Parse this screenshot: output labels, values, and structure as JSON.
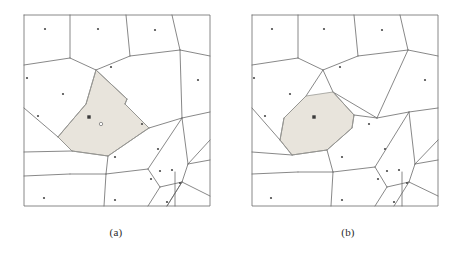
{
  "figure": {
    "type": "voronoi-diagram-pair",
    "background_color": "#ffffff",
    "edge_color": "#6a6a6a",
    "highlight_fill_color": "#e8e4dc",
    "highlight_edge_color": "#9a9a96",
    "site_color": "#4a4a4a"
  },
  "panels": [
    {
      "id": "a",
      "caption": "(a)",
      "bbox": {
        "x": 24,
        "y": 15,
        "width": 186,
        "height": 191
      },
      "highlight": {
        "kind": "narrow-corridor-cell",
        "label": "o",
        "label_x": 101,
        "label_y": 124,
        "marker_x": 89,
        "marker_y": 117,
        "marker_shape": "filled-square",
        "polygon": [
          [
            96,
            70
          ],
          [
            127,
            99
          ],
          [
            125,
            104
          ],
          [
            149,
            128
          ],
          [
            143,
            132
          ],
          [
            108,
            156
          ],
          [
            72,
            151
          ],
          [
            58,
            137
          ],
          [
            63,
            131
          ],
          [
            86,
            104
          ]
        ]
      },
      "sites": [
        [
          45,
          29
        ],
        [
          98,
          29
        ],
        [
          155,
          30
        ],
        [
          27,
          78
        ],
        [
          63,
          94
        ],
        [
          111,
          67
        ],
        [
          198,
          80
        ],
        [
          38,
          116
        ],
        [
          142,
          124
        ],
        [
          89,
          117
        ],
        [
          115,
          157
        ],
        [
          158,
          149
        ],
        [
          160,
          171
        ],
        [
          172,
          170
        ],
        [
          151,
          179
        ],
        [
          180,
          183
        ],
        [
          44,
          198
        ],
        [
          115,
          200
        ],
        [
          167,
          202
        ]
      ],
      "edges": [
        [
          [
            24,
            15
          ],
          [
            210,
            15
          ],
          [
            210,
            206
          ],
          [
            24,
            206
          ],
          [
            24,
            15
          ]
        ],
        [
          [
            70,
            15
          ],
          [
            70,
            58
          ]
        ],
        [
          [
            70,
            58
          ],
          [
            24,
            65
          ]
        ],
        [
          [
            70,
            58
          ],
          [
            96,
            70
          ]
        ],
        [
          [
            126,
            15
          ],
          [
            130,
            56
          ]
        ],
        [
          [
            130,
            56
          ],
          [
            96,
            70
          ]
        ],
        [
          [
            130,
            56
          ],
          [
            180,
            50
          ]
        ],
        [
          [
            180,
            50
          ],
          [
            210,
            56
          ]
        ],
        [
          [
            180,
            50
          ],
          [
            172,
            15
          ]
        ],
        [
          [
            96,
            70
          ],
          [
            86,
            104
          ]
        ],
        [
          [
            86,
            104
          ],
          [
            63,
            131
          ]
        ],
        [
          [
            63,
            131
          ],
          [
            58,
            137
          ]
        ],
        [
          [
            58,
            137
          ],
          [
            24,
            108
          ]
        ],
        [
          [
            58,
            137
          ],
          [
            72,
            151
          ]
        ],
        [
          [
            72,
            151
          ],
          [
            24,
            152
          ]
        ],
        [
          [
            72,
            151
          ],
          [
            108,
            156
          ]
        ],
        [
          [
            108,
            156
          ],
          [
            143,
            132
          ]
        ],
        [
          [
            143,
            132
          ],
          [
            149,
            128
          ]
        ],
        [
          [
            149,
            128
          ],
          [
            182,
            118
          ]
        ],
        [
          [
            182,
            118
          ],
          [
            210,
            112
          ]
        ],
        [
          [
            182,
            118
          ],
          [
            180,
            50
          ]
        ],
        [
          [
            127,
            99
          ],
          [
            125,
            104
          ]
        ],
        [
          [
            96,
            70
          ],
          [
            127,
            99
          ]
        ],
        [
          [
            125,
            104
          ],
          [
            149,
            128
          ]
        ],
        [
          [
            108,
            156
          ],
          [
            106,
            174
          ]
        ],
        [
          [
            106,
            174
          ],
          [
            70,
            174
          ]
        ],
        [
          [
            70,
            174
          ],
          [
            24,
            176
          ]
        ],
        [
          [
            106,
            174
          ],
          [
            104,
            206
          ]
        ],
        [
          [
            106,
            174
          ],
          [
            148,
            169
          ]
        ],
        [
          [
            148,
            169
          ],
          [
            182,
            118
          ]
        ],
        [
          [
            148,
            169
          ],
          [
            160,
            187
          ]
        ],
        [
          [
            160,
            187
          ],
          [
            148,
            206
          ]
        ],
        [
          [
            160,
            187
          ],
          [
            182,
            182
          ]
        ],
        [
          [
            182,
            182
          ],
          [
            167,
            206
          ]
        ],
        [
          [
            182,
            182
          ],
          [
            188,
            164
          ]
        ],
        [
          [
            188,
            164
          ],
          [
            182,
            118
          ]
        ],
        [
          [
            188,
            164
          ],
          [
            210,
            160
          ]
        ],
        [
          [
            182,
            182
          ],
          [
            210,
            196
          ]
        ],
        [
          [
            167,
            206
          ],
          [
            182,
            182
          ]
        ],
        [
          [
            175,
            172
          ],
          [
            175,
            206
          ]
        ],
        [
          [
            188,
            164
          ],
          [
            210,
            140
          ]
        ]
      ]
    },
    {
      "id": "b",
      "caption": "(b)",
      "bbox": {
        "x": 20,
        "y": 15,
        "width": 186,
        "height": 191
      },
      "highlight": {
        "kind": "wide-elongated-cell",
        "marker_x": 82,
        "marker_y": 117,
        "marker_shape": "filled-square",
        "polygon": [
          [
            101,
            92
          ],
          [
            122,
            115
          ],
          [
            120,
            128
          ],
          [
            95,
            150
          ],
          [
            60,
            155
          ],
          [
            48,
            140
          ],
          [
            52,
            118
          ],
          [
            74,
            96
          ]
        ]
      },
      "sites": [
        [
          40,
          29
        ],
        [
          92,
          29
        ],
        [
          150,
          30
        ],
        [
          22,
          78
        ],
        [
          58,
          94
        ],
        [
          108,
          67
        ],
        [
          193,
          80
        ],
        [
          33,
          116
        ],
        [
          137,
          124
        ],
        [
          82,
          117
        ],
        [
          110,
          157
        ],
        [
          153,
          149
        ],
        [
          155,
          171
        ],
        [
          167,
          170
        ],
        [
          146,
          179
        ],
        [
          175,
          183
        ],
        [
          39,
          198
        ],
        [
          110,
          200
        ],
        [
          162,
          202
        ]
      ],
      "edges": [
        [
          [
            20,
            15
          ],
          [
            206,
            15
          ],
          [
            206,
            206
          ],
          [
            20,
            206
          ],
          [
            20,
            15
          ]
        ],
        [
          [
            66,
            15
          ],
          [
            66,
            58
          ]
        ],
        [
          [
            66,
            58
          ],
          [
            20,
            65
          ]
        ],
        [
          [
            66,
            58
          ],
          [
            91,
            70
          ]
        ],
        [
          [
            122,
            15
          ],
          [
            126,
            56
          ]
        ],
        [
          [
            126,
            56
          ],
          [
            91,
            70
          ]
        ],
        [
          [
            126,
            56
          ],
          [
            176,
            50
          ]
        ],
        [
          [
            176,
            50
          ],
          [
            206,
            56
          ]
        ],
        [
          [
            176,
            50
          ],
          [
            168,
            15
          ]
        ],
        [
          [
            91,
            70
          ],
          [
            74,
            96
          ]
        ],
        [
          [
            74,
            96
          ],
          [
            52,
            118
          ]
        ],
        [
          [
            52,
            118
          ],
          [
            48,
            140
          ]
        ],
        [
          [
            48,
            140
          ],
          [
            20,
            108
          ]
        ],
        [
          [
            48,
            140
          ],
          [
            60,
            155
          ]
        ],
        [
          [
            60,
            155
          ],
          [
            20,
            152
          ]
        ],
        [
          [
            60,
            155
          ],
          [
            95,
            150
          ]
        ],
        [
          [
            95,
            150
          ],
          [
            120,
            128
          ]
        ],
        [
          [
            120,
            128
          ],
          [
            122,
            115
          ]
        ],
        [
          [
            122,
            115
          ],
          [
            101,
            92
          ]
        ],
        [
          [
            101,
            92
          ],
          [
            91,
            70
          ]
        ],
        [
          [
            101,
            92
          ],
          [
            145,
            118
          ]
        ],
        [
          [
            145,
            118
          ],
          [
            122,
            115
          ]
        ],
        [
          [
            145,
            118
          ],
          [
            176,
            50
          ]
        ],
        [
          [
            145,
            118
          ],
          [
            177,
            112
          ]
        ],
        [
          [
            177,
            112
          ],
          [
            206,
            108
          ]
        ],
        [
          [
            95,
            150
          ],
          [
            101,
            172
          ]
        ],
        [
          [
            101,
            172
          ],
          [
            66,
            172
          ]
        ],
        [
          [
            66,
            172
          ],
          [
            20,
            174
          ]
        ],
        [
          [
            101,
            172
          ],
          [
            99,
            206
          ]
        ],
        [
          [
            101,
            172
          ],
          [
            143,
            167
          ]
        ],
        [
          [
            143,
            167
          ],
          [
            177,
            112
          ]
        ],
        [
          [
            143,
            167
          ],
          [
            155,
            187
          ]
        ],
        [
          [
            155,
            187
          ],
          [
            143,
            206
          ]
        ],
        [
          [
            155,
            187
          ],
          [
            177,
            182
          ]
        ],
        [
          [
            177,
            182
          ],
          [
            162,
            206
          ]
        ],
        [
          [
            177,
            182
          ],
          [
            183,
            164
          ]
        ],
        [
          [
            183,
            164
          ],
          [
            177,
            112
          ]
        ],
        [
          [
            183,
            164
          ],
          [
            206,
            160
          ]
        ],
        [
          [
            177,
            182
          ],
          [
            206,
            196
          ]
        ],
        [
          [
            170,
            172
          ],
          [
            170,
            206
          ]
        ],
        [
          [
            183,
            164
          ],
          [
            206,
            140
          ]
        ]
      ]
    }
  ]
}
